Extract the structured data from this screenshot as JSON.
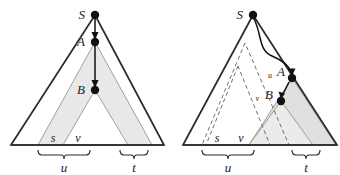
{
  "figure": {
    "background_color": "#ffffff",
    "stroke_color": "#2b2b2b",
    "shade_color": "#e8e8e8",
    "node_color": "#111111",
    "panels": [
      {
        "id": "left",
        "nodes": [
          {
            "name": "S",
            "label": "S",
            "x": 95,
            "y": 15
          },
          {
            "name": "A",
            "label": "A",
            "x": 95,
            "y": 42
          },
          {
            "name": "B",
            "label": "B",
            "x": 95,
            "y": 90
          }
        ],
        "arrows": [
          {
            "from": "S",
            "to": "A",
            "style": "straight"
          },
          {
            "from": "A",
            "to": "B",
            "style": "straight"
          }
        ],
        "brace_labels": [
          {
            "name": "u",
            "label": "u"
          },
          {
            "name": "t",
            "label": "t"
          }
        ],
        "segment_labels": [
          {
            "name": "s",
            "label": "s"
          },
          {
            "name": "v",
            "label": "v"
          }
        ]
      },
      {
        "id": "right",
        "nodes": [
          {
            "name": "S",
            "label": "S",
            "x": 253,
            "y": 15
          },
          {
            "name": "A",
            "label": "A",
            "x": 292,
            "y": 78,
            "prefix": "u"
          },
          {
            "name": "B",
            "label": "B",
            "x": 281,
            "y": 101,
            "prefix": "v"
          }
        ],
        "arrows": [
          {
            "from": "S",
            "to": "A",
            "style": "curved"
          },
          {
            "from": "A",
            "to": "B",
            "style": "curved"
          }
        ],
        "brace_labels": [
          {
            "name": "u",
            "label": "u"
          },
          {
            "name": "t",
            "label": "t"
          }
        ],
        "segment_labels": [
          {
            "name": "s",
            "label": "s"
          },
          {
            "name": "v",
            "label": "v"
          }
        ]
      }
    ]
  }
}
